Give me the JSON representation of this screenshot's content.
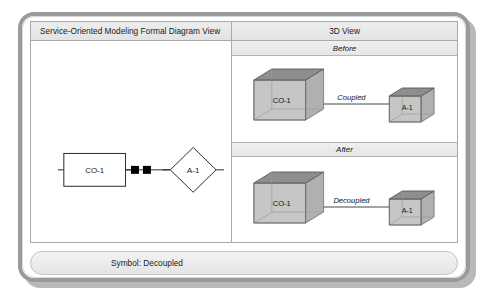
{
  "figure": {
    "left_panel_title": "Service-Oriented Modeling Formal Diagram View",
    "right_panel_title": "3D View",
    "caption": "Symbol: Decoupled"
  },
  "formal_diagram": {
    "source_node": "CO-1",
    "target_node": "A-1",
    "connector_markers": 2
  },
  "scenes": [
    {
      "band_label": "Before",
      "big_cube_label": "CO-1",
      "small_cube_label": "A-1",
      "relation_label": "Coupled"
    },
    {
      "band_label": "After",
      "big_cube_label": "CO-1",
      "small_cube_label": "A-1",
      "relation_label": "Decoupled"
    }
  ],
  "colors": {
    "frame_border": "#9a9a9a",
    "header_band": "#e8e8e8",
    "cube_top": "#8e8e8e",
    "cube_front": "#c4c4c4",
    "cube_side": "#a8a8a8",
    "line": "#3a3a3a"
  }
}
